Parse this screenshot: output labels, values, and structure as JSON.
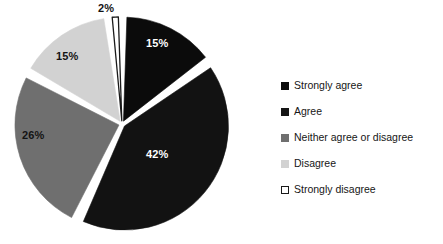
{
  "chart_data": {
    "type": "pie",
    "title": "",
    "subtitle": "",
    "xlabel": "",
    "ylabel": "",
    "grid": false,
    "legend_position": "right",
    "categories": [
      "Strongly agree",
      "Agree",
      "Neither agree or disagree",
      "Disagree",
      "Strongly disagree"
    ],
    "values": [
      15,
      42,
      26,
      15,
      2
    ],
    "data_labels": [
      "15%",
      "42%",
      "26%",
      "15%",
      "2%"
    ],
    "colors": [
      "#0b0b0b",
      "#121212",
      "#6f6f6f",
      "#d2d2d2",
      "#ffffff"
    ],
    "slice_border_color": "#ffffff",
    "outlined_slice_border": "#1a1a1a",
    "label_text_colors": [
      "#ffffff",
      "#ffffff",
      "#141414",
      "#141414",
      "#141414"
    ],
    "start_angle_deg": 0,
    "direction": "clockwise",
    "exploded": true,
    "units": "percent"
  },
  "legend": {
    "items": [
      {
        "label": "Strongly agree",
        "swatch": "#0b0b0b",
        "swatch_border": "#0b0b0b"
      },
      {
        "label": "Agree",
        "swatch": "#151515",
        "swatch_border": "#151515"
      },
      {
        "label": "Neither agree or disagree",
        "swatch": "#6f6f6f",
        "swatch_border": "#6f6f6f"
      },
      {
        "label": "Disagree",
        "swatch": "#d2d2d2",
        "swatch_border": "#d2d2d2"
      },
      {
        "label": "Strongly disagree",
        "swatch": "#ffffff",
        "swatch_border": "#1a1a1a"
      }
    ]
  },
  "labels": {
    "strongly_agree": "15%",
    "agree": "42%",
    "neither": "26%",
    "disagree": "15%",
    "strongly_disagree": "2%"
  }
}
